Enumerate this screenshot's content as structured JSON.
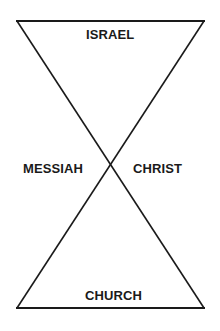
{
  "diagram": {
    "title": "",
    "shape": "hourglass",
    "colors": {
      "stroke": "#1a1a1a",
      "text": "#1a1a1a",
      "background": "#ffffff"
    },
    "geometry": {
      "top_left": [
        17,
        21
      ],
      "top_right": [
        204,
        21
      ],
      "bottom_left": [
        17,
        308
      ],
      "bottom_right": [
        204,
        308
      ],
      "crossing_point": [
        110,
        163
      ]
    },
    "labels": {
      "top": "ISRAEL",
      "left": "MESSIAH",
      "right": "CHRIST",
      "bottom": "CHURCH"
    }
  }
}
